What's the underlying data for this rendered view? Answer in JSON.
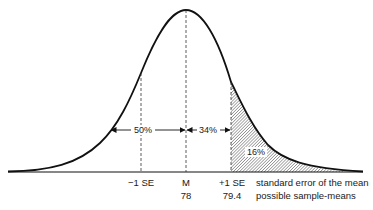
{
  "diagram": {
    "regions": {
      "left_half": "50%",
      "mean_to_plus1": "34%",
      "upper_tail": "16%"
    },
    "axis_ticks": {
      "minus1": "−1 SE",
      "mean": "M",
      "plus1": "+1 SE"
    },
    "axis_values": {
      "mean": "78",
      "plus1": "79.4"
    },
    "row_labels": {
      "row1": "standard error of the mean",
      "row2": "possible sample-means"
    },
    "colors": {
      "stroke": "#111111",
      "hatch": "#555555",
      "background": "#ffffff"
    }
  }
}
